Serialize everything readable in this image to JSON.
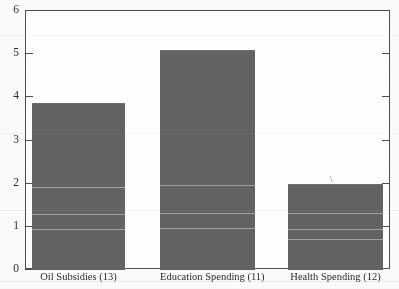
{
  "chart_data": {
    "type": "bar",
    "title": "",
    "xlabel": "",
    "ylabel": "",
    "categories": [
      "Oil Subsidies (13)",
      "Education Spending (11)",
      "Health Spending (12)"
    ],
    "values": [
      3.84,
      5.07,
      1.97
    ],
    "ylim": [
      0,
      6
    ],
    "yticks": [
      0,
      1,
      2,
      3,
      4,
      5,
      6
    ],
    "ytick_labels": [
      "0",
      "1",
      "2",
      "3",
      "4",
      "5",
      "6"
    ],
    "grid": false,
    "legend": false,
    "bar_color": "#636363",
    "axis_color": "#4e4e4e",
    "background_color": "#fbfbf9",
    "annotations": [
      "stray ink mark above Health Spending bar"
    ]
  },
  "axis": {
    "y_labels": [
      "6",
      "5",
      "4",
      "3",
      "2",
      "1",
      "0"
    ]
  },
  "marks": {
    "stray": "\\"
  }
}
